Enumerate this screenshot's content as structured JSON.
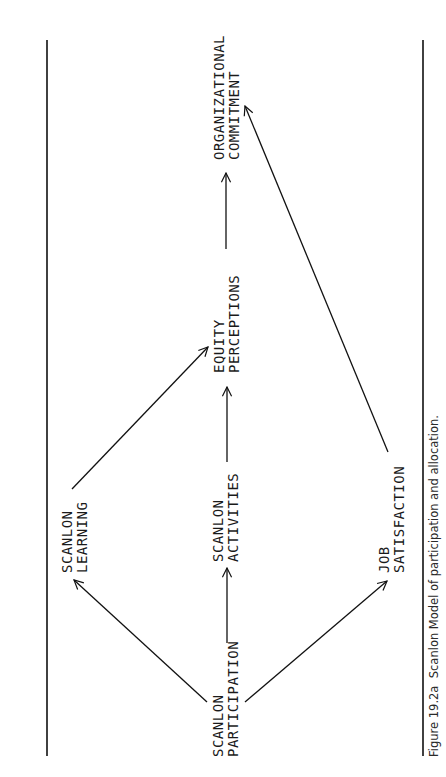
{
  "figure": {
    "caption": "Figure 19.2a  Scanlon Model of participation and allocation.",
    "orientation": "rotated 90° counter-clockwise"
  },
  "nodes": {
    "participation": {
      "line1": "SCANLON",
      "line2": "PARTICIPATION"
    },
    "learning": {
      "line1": "SCANLON",
      "line2": "LEARNING"
    },
    "activities": {
      "line1": "SCANLON",
      "line2": "ACTIVITIES"
    },
    "job_satisfaction": {
      "line1": "JOB",
      "line2": "SATISFACTION"
    },
    "equity": {
      "line1": "EQUITY",
      "line2": "PERCEPTIONS"
    },
    "commitment": {
      "line1": "ORGANIZATIONAL",
      "line2": "COMMITMENT"
    }
  },
  "edges": [
    {
      "from": "SCANLON PARTICIPATION",
      "to": "SCANLON LEARNING"
    },
    {
      "from": "SCANLON PARTICIPATION",
      "to": "SCANLON ACTIVITIES"
    },
    {
      "from": "SCANLON PARTICIPATION",
      "to": "JOB SATISFACTION"
    },
    {
      "from": "SCANLON LEARNING",
      "to": "EQUITY PERCEPTIONS"
    },
    {
      "from": "SCANLON ACTIVITIES",
      "to": "EQUITY PERCEPTIONS"
    },
    {
      "from": "EQUITY PERCEPTIONS",
      "to": "ORGANIZATIONAL COMMITMENT"
    },
    {
      "from": "JOB SATISFACTION",
      "to": "ORGANIZATIONAL COMMITMENT"
    }
  ]
}
